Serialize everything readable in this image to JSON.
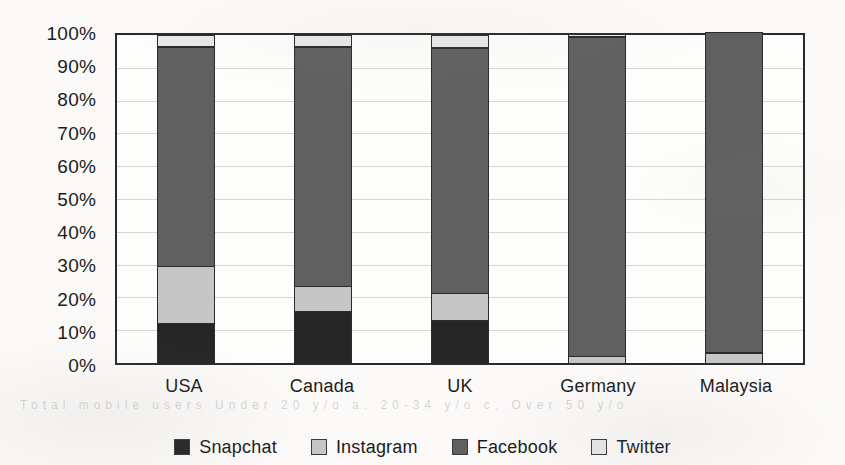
{
  "chart_data": {
    "type": "bar",
    "subtype": "stacked-bar-100",
    "title": "",
    "subtitle": "",
    "xlabel": "",
    "ylabel": "",
    "categories": [
      "USA",
      "Canada",
      "UK",
      "Germany",
      "Malaysia"
    ],
    "series": [
      {
        "name": "Snapchat",
        "color": "#262626",
        "values": [
          12.5,
          16.0,
          13.5,
          0.0,
          0.0
        ]
      },
      {
        "name": "Instagram",
        "color": "#c6c6c6",
        "values": [
          17.5,
          8.0,
          8.5,
          2.5,
          3.5
        ]
      },
      {
        "name": "Facebook",
        "color": "#606060",
        "values": [
          66.5,
          72.5,
          74.0,
          96.5,
          96.5
        ]
      },
      {
        "name": "Twitter",
        "color": "#e8e8e8",
        "values": [
          3.5,
          3.5,
          4.0,
          1.0,
          0.0
        ]
      }
    ],
    "ylim": [
      0,
      100
    ],
    "ytick_values": [
      0,
      10,
      20,
      30,
      40,
      50,
      60,
      70,
      80,
      90,
      100
    ],
    "ytick_labels": [
      "0%",
      "10%",
      "20%",
      "30%",
      "40%",
      "50%",
      "60%",
      "70%",
      "80%",
      "90%",
      "100%"
    ],
    "grid": true,
    "grid_axis": "y",
    "legend_position": "bottom",
    "legend_entries": [
      "Snapchat",
      "Instagram",
      "Facebook",
      "Twitter"
    ]
  },
  "axes": {
    "y_ticks": [
      {
        "label": "100%",
        "value": 100
      },
      {
        "label": "90%",
        "value": 90
      },
      {
        "label": "80%",
        "value": 80
      },
      {
        "label": "70%",
        "value": 70
      },
      {
        "label": "60%",
        "value": 60
      },
      {
        "label": "50%",
        "value": 50
      },
      {
        "label": "40%",
        "value": 40
      },
      {
        "label": "30%",
        "value": 30
      },
      {
        "label": "20%",
        "value": 20
      },
      {
        "label": "10%",
        "value": 10
      },
      {
        "label": "0%",
        "value": 0
      }
    ],
    "x_ticks": [
      {
        "label": "USA"
      },
      {
        "label": "Canada"
      },
      {
        "label": "UK"
      },
      {
        "label": "Germany"
      },
      {
        "label": "Malaysia"
      }
    ]
  },
  "legend": {
    "items": [
      {
        "label": "Snapchat",
        "color": "#262626"
      },
      {
        "label": "Instagram",
        "color": "#c6c6c6"
      },
      {
        "label": "Facebook",
        "color": "#606060"
      },
      {
        "label": "Twitter",
        "color": "#e8e8e8"
      }
    ]
  },
  "artifacts": {
    "ghost_text": "Total mobile users Under 20 y/o  a. 20-34 y/o   c. Over 50 y/o"
  },
  "colors": {
    "background": "#fbfaf8",
    "plot_background": "#fdfdfc",
    "frame": "#2b2b2b",
    "gridline": "#d8d6d2",
    "text": "#1b1b1b"
  }
}
